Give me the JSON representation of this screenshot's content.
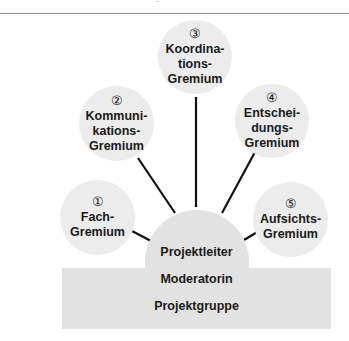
{
  "diagram": {
    "title": "",
    "committees": [
      {
        "number": "①",
        "lines": [
          "Fach-",
          "Gremium"
        ]
      },
      {
        "number": "②",
        "lines": [
          "Kommuni-",
          "kations-",
          "Gremium"
        ]
      },
      {
        "number": "③",
        "lines": [
          "Koordina-",
          "tions-",
          "Gremium"
        ]
      },
      {
        "number": "④",
        "lines": [
          "Entschei-",
          "dungs-",
          "Gremium"
        ]
      },
      {
        "number": "⑤",
        "lines": [
          "Aufsichts-",
          "Gremium"
        ]
      }
    ],
    "center": {
      "projektleiter": "Projektleiter",
      "moderatorin": "Moderatorin",
      "projektgruppe": "Projektgruppe"
    },
    "colors": {
      "circle_fill": "#ececec",
      "base_fill": "#e2e2e2",
      "line": "#111111",
      "text": "#1a1a1a"
    }
  }
}
